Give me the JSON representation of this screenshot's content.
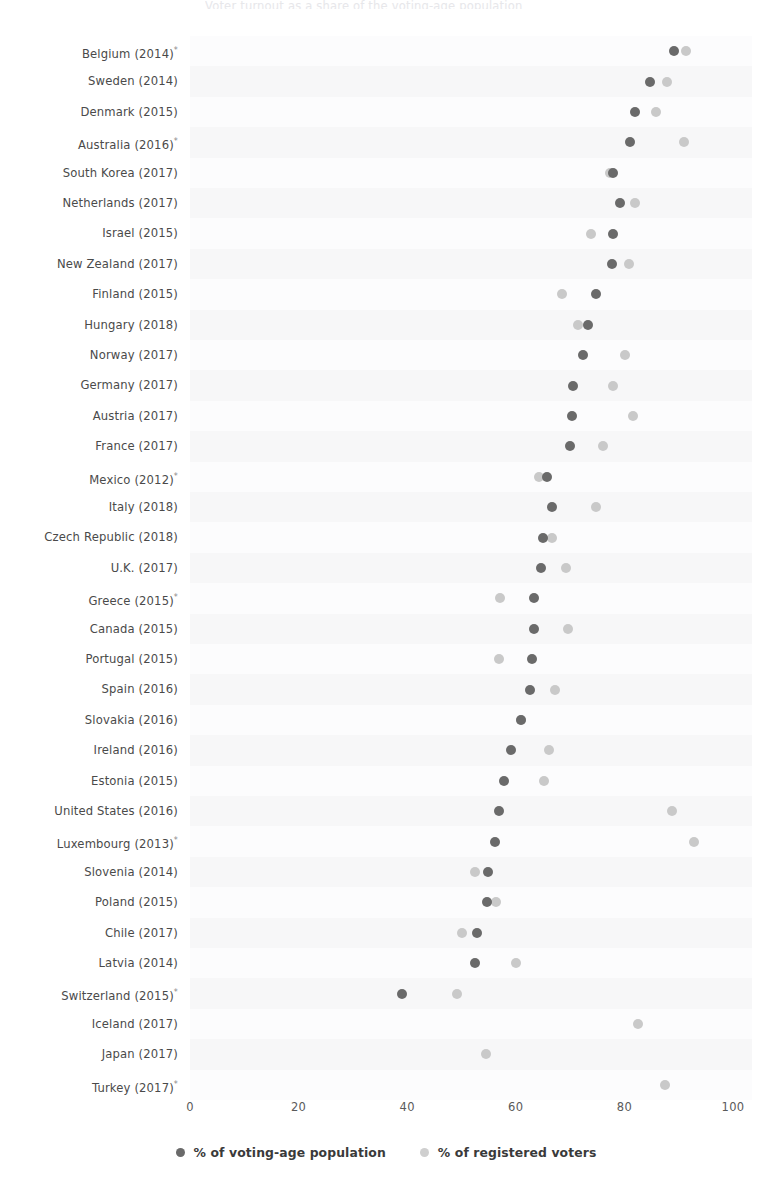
{
  "title": "Voter turnout as a share of the voting-age population",
  "axis": {
    "ticks": [
      "0",
      "20",
      "40",
      "60",
      "80",
      "100"
    ],
    "tick_values": [
      0,
      20,
      40,
      60,
      80,
      100
    ],
    "min": 0,
    "max": 100
  },
  "legend": {
    "items": [
      {
        "label": "% of voting-age population",
        "color": "#6a6a6a",
        "key": "voting_age"
      },
      {
        "label": "% of registered voters",
        "color": "#cfcfcf",
        "key": "registered"
      }
    ]
  },
  "footnote_marker": "*",
  "chart_data": {
    "type": "scatter",
    "title": "Voter turnout as a share of the voting-age population",
    "xlabel": "",
    "ylabel": "",
    "xlim": [
      0,
      100
    ],
    "grid": false,
    "legend_position": "bottom",
    "categories": [
      "Belgium (2014)*",
      "Sweden (2014)",
      "Denmark (2015)",
      "Australia (2016)*",
      "South Korea (2017)",
      "Netherlands (2017)",
      "Israel (2015)",
      "New Zealand (2017)",
      "Finland (2015)",
      "Hungary (2018)",
      "Norway (2017)",
      "Germany (2017)",
      "Austria (2017)",
      "France (2017)",
      "Mexico (2012)*",
      "Italy (2018)",
      "Czech Republic (2018)",
      "U.K. (2017)",
      "Greece (2015)*",
      "Canada (2015)",
      "Portugal (2015)",
      "Spain (2016)",
      "Slovakia (2016)",
      "Ireland (2016)",
      "Estonia (2015)",
      "United States (2016)",
      "Luxembourg (2013)*",
      "Slovenia (2014)",
      "Poland (2015)",
      "Chile (2017)",
      "Latvia (2014)",
      "Switzerland (2015)*",
      "Iceland (2017)",
      "Japan (2017)",
      "Turkey (2017)*"
    ],
    "series": [
      {
        "name": "% of voting-age population",
        "color": "#6a6a6a",
        "values": [
          89.2,
          84.7,
          81.9,
          81.0,
          77.9,
          79.2,
          77.9,
          77.7,
          74.8,
          73.3,
          72.3,
          70.5,
          70.3,
          70.0,
          65.8,
          66.7,
          65.0,
          64.7,
          63.3,
          63.3,
          62.9,
          62.6,
          61.0,
          59.1,
          57.8,
          56.9,
          56.1,
          54.9,
          54.7,
          52.8,
          52.4,
          39.0,
          null,
          null,
          null
        ]
      },
      {
        "name": "% of registered voters",
        "color": "#c9c9c9",
        "values": [
          91.4,
          87.8,
          85.9,
          91.0,
          77.3,
          81.9,
          73.8,
          80.8,
          68.5,
          71.5,
          80.1,
          77.9,
          81.6,
          76.1,
          64.3,
          74.7,
          66.6,
          69.2,
          57.1,
          69.6,
          56.9,
          67.3,
          61.0,
          66.1,
          65.2,
          88.8,
          92.8,
          52.4,
          56.3,
          50.1,
          60.0,
          49.2,
          82.5,
          54.6,
          87.5
        ]
      }
    ]
  }
}
